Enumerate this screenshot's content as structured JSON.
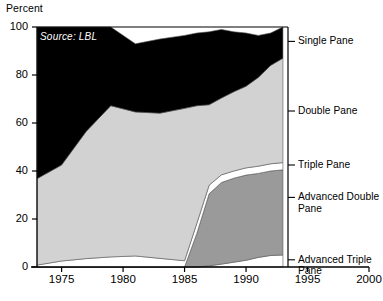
{
  "chart_data": {
    "type": "area",
    "title": "",
    "subtitle": "",
    "source_note": "Source: LBL",
    "ylabel": "Percent",
    "xlabel": "",
    "xlim": [
      1973,
      2000
    ],
    "ylim": [
      0,
      100
    ],
    "grid": false,
    "stacked": true,
    "legend_position": "right-outside",
    "yticks": [
      0,
      20,
      40,
      60,
      80,
      100
    ],
    "ytick_labels": [
      "0",
      "20",
      "40",
      "60",
      "80",
      "100"
    ],
    "xticks": [
      1975,
      1980,
      1985,
      1990,
      1995,
      2000
    ],
    "xtick_labels": [
      "1975",
      "1980",
      "1985",
      "1990",
      "1995",
      "2000"
    ],
    "x": [
      1973,
      1975,
      1977,
      1979,
      1981,
      1983,
      1985,
      1986,
      1987,
      1988,
      1989,
      1990,
      1991,
      1992,
      1993
    ],
    "series": [
      {
        "name": "Advanced Triple Pane",
        "color": "#ffffff",
        "values": [
          0,
          0,
          0,
          0,
          0,
          0,
          0,
          0,
          0.5,
          1.2,
          2.0,
          2.8,
          4.0,
          4.8,
          5.0
        ]
      },
      {
        "name": "Advanced Double Pane",
        "color": "#9a9a9a",
        "values": [
          0,
          0,
          0,
          0,
          0,
          0,
          0,
          14.0,
          30.0,
          34.0,
          35.0,
          35.5,
          35.0,
          35.2,
          35.5
        ]
      },
      {
        "name": "Triple Pane",
        "color": "#ffffff",
        "values": [
          0.8,
          2.5,
          3.5,
          4.2,
          4.6,
          3.6,
          2.6,
          4.2,
          3.6,
          3.2,
          3.0,
          3.0,
          3.0,
          3.0,
          3.0
        ]
      },
      {
        "name": "Double Pane",
        "color": "#d2d2d2",
        "values": [
          36.0,
          40.0,
          53.0,
          63.0,
          60.0,
          60.5,
          63.5,
          49.0,
          33.5,
          32.0,
          33.0,
          34.0,
          37.0,
          41.0,
          43.5
        ]
      },
      {
        "name": "Single Pane",
        "color": "#000000",
        "values": [
          63.2,
          57.5,
          43.5,
          32.8,
          28.4,
          30.9,
          30.4,
          30.3,
          30.4,
          28.6,
          25.0,
          22.2,
          17.5,
          13.5,
          13.0
        ]
      }
    ],
    "legend_entries": [
      {
        "label": "Single Pane",
        "y_at_label": 94.0,
        "swatch": "#000000"
      },
      {
        "label": "Double Pane",
        "y_at_label": 65.0,
        "swatch": "#d2d2d2"
      },
      {
        "label": "Triple Pane",
        "y_at_label": 42.5,
        "swatch": "#ffffff"
      },
      {
        "label": "Advanced Double\nPane",
        "y_at_label": 29.0,
        "swatch": "#9a9a9a"
      },
      {
        "label": "Advanced Triple\nPane",
        "y_at_label": 3.0,
        "swatch": "#ffffff"
      }
    ]
  },
  "axis": {
    "y_title": "Percent"
  }
}
